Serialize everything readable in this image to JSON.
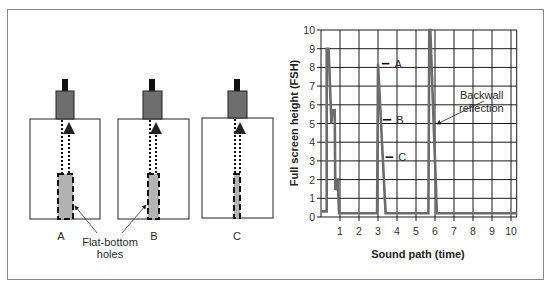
{
  "figure": {
    "left_panel": {
      "specimens": [
        {
          "label": "A",
          "hole_size": "large"
        },
        {
          "label": "B",
          "hole_size": "medium"
        },
        {
          "label": "C",
          "hole_size": "small"
        }
      ],
      "callout_line1": "Flat-bottom",
      "callout_line2": "holes"
    },
    "colors": {
      "trace": "#6b6b6b",
      "grid": "#1a1a1a",
      "transducer": "#6e6e6e",
      "connector": "#111111",
      "hole_fill": "#b3b3b3",
      "frame": "#8a8a8a"
    }
  },
  "chart_data": {
    "type": "line",
    "title": "",
    "xlabel": "Sound path (time)",
    "ylabel": "Full screen height (FSH)",
    "xlim": [
      0,
      10.3
    ],
    "ylim": [
      0,
      10
    ],
    "x_ticks": [
      "1",
      "2",
      "3",
      "4",
      "5",
      "6",
      "7",
      "8",
      "9",
      "10"
    ],
    "y_ticks": [
      "0",
      "1",
      "2",
      "3",
      "4",
      "5",
      "6",
      "7",
      "8",
      "9",
      "10"
    ],
    "grid": true,
    "legend": null,
    "series": [
      {
        "name": "A-scan trace",
        "points": [
          [
            0,
            0.3
          ],
          [
            0.3,
            0.3
          ],
          [
            0.3,
            9
          ],
          [
            0.4,
            9
          ],
          [
            0.55,
            5
          ],
          [
            0.6,
            5.7
          ],
          [
            0.72,
            5.7
          ],
          [
            0.75,
            1.5
          ],
          [
            0.8,
            1.5
          ],
          [
            0.82,
            2
          ],
          [
            0.88,
            2
          ],
          [
            0.95,
            0.2
          ],
          [
            2.95,
            0.2
          ],
          [
            3.0,
            8.2
          ],
          [
            3.4,
            0.2
          ],
          [
            5.65,
            0.2
          ],
          [
            5.7,
            10
          ],
          [
            5.75,
            10
          ],
          [
            6.1,
            0.2
          ],
          [
            10.3,
            0.2
          ]
        ]
      }
    ],
    "markers": [
      {
        "label": "A",
        "y": 8.2,
        "x_start": 3.2,
        "x_end": 3.6
      },
      {
        "label": "B",
        "y": 5.2,
        "x_start": 3.25,
        "x_end": 3.7
      },
      {
        "label": "C",
        "y": 3.2,
        "x_start": 3.4,
        "x_end": 3.8
      }
    ],
    "annotations": [
      {
        "text_line1": "Backwall",
        "text_line2": "reflection",
        "points_to": [
          5.75,
          5.6
        ]
      }
    ]
  }
}
